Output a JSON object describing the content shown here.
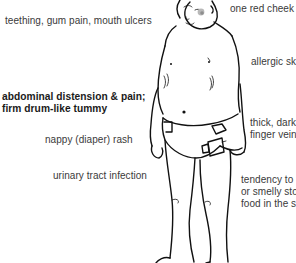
{
  "diagram": {
    "labels": {
      "teething": "teething, gum pain, mouth ulcers",
      "red_cheek": "one red cheek",
      "allergic_skin": "allergic sk",
      "abdominal_line1": "abdominal distension & pain;",
      "abdominal_line2": "firm drum-like tummy",
      "nappy_rash": "nappy (diaper) rash",
      "thick_veins_line1": "thick, dark",
      "thick_veins_line2": "finger vein",
      "uti": "urinary tract infection",
      "stools_line1": "tendency to",
      "stools_line2": "or smelly sto",
      "stools_line3": "food in the s"
    },
    "colors": {
      "text": "#3a3a3a",
      "emphasis_text": "#1a1a1a",
      "line_art": "#111111",
      "cheek_mark": "#9a9a9a"
    }
  }
}
